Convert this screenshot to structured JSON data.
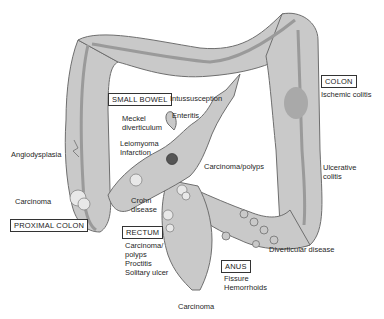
{
  "diagram": {
    "regions": {
      "small_bowel": "SMALL BOWEL",
      "colon": "COLON",
      "proximal_colon": "PROXIMAL COLON",
      "rectum": "RECTUM",
      "anus": "ANUS"
    },
    "labels": {
      "intussusception": "Intussusception",
      "enteritis": "Enteritis",
      "meckel_1": "Meckel",
      "meckel_2": "diverticulum",
      "leiomyoma": "Leiomyoma",
      "infarction": "Infarction",
      "angiodysplasia": "Angiodysplasia",
      "carcinoma_proximal": "Carcinoma",
      "crohn_1": "Crohn",
      "crohn_2": "disease",
      "carcinoma_polyps_mid": "Carcinoma/polyps",
      "ischemic_colitis": "Ischemic colitis",
      "ulcerative_1": "Ulcerative",
      "ulcerative_2": "colitis",
      "rectum_1": "Carcinoma/",
      "rectum_2": "polyps",
      "rectum_3": "Proctitis",
      "rectum_4": "Solitary ulcer",
      "diverticular": "Diverticular disease",
      "fissure": "Fissure",
      "hemorrhoids": "Hemorrhoids",
      "carcinoma_anal": "Carcinoma"
    },
    "colors": {
      "bowel_fill": "#c9c9c9",
      "bowel_stroke": "#6e6e6e",
      "taenia": "#9a9a9a",
      "lesion": "#8a8a8a",
      "meckel_dot": "#555555"
    }
  }
}
